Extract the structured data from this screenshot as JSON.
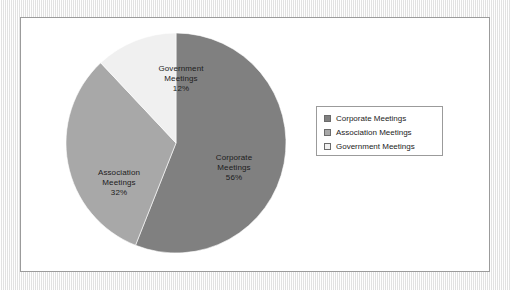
{
  "chart_data": {
    "type": "pie",
    "title": "",
    "subtitle": "",
    "xlabel": "",
    "ylabel": "",
    "grid": false,
    "legend_position": "right",
    "start_angle_deg": 0,
    "direction": "clockwise",
    "categories": [
      "Corporate Meetings",
      "Association Meetings",
      "Government Meetings"
    ],
    "values": [
      56,
      32,
      12
    ],
    "value_unit": "%",
    "colors": [
      "#808080",
      "#a8a8a8",
      "#f0f0f0"
    ],
    "slices": [
      {
        "name": "Corporate Meetings",
        "value": 56,
        "value_label": "56%",
        "color": "#808080",
        "label_lines": [
          "Corporate",
          "Meetings",
          "56%"
        ]
      },
      {
        "name": "Association Meetings",
        "value": 32,
        "value_label": "32%",
        "color": "#a8a8a8",
        "label_lines": [
          "Association",
          "Meetings",
          "32%"
        ]
      },
      {
        "name": "Government Meetings",
        "value": 12,
        "value_label": "12%",
        "color": "#f0f0f0",
        "label_lines": [
          "Government",
          "Meetings",
          "12%"
        ]
      }
    ]
  },
  "pie_labels": {
    "corporate": {
      "line1": "Corporate",
      "line2": "Meetings",
      "line3": "56%"
    },
    "association": {
      "line1": "Association",
      "line2": "Meetings",
      "line3": "32%"
    },
    "government": {
      "line1": "Government",
      "line2": "Meetings",
      "line3": "12%"
    }
  },
  "legend": {
    "items": [
      {
        "label": "Corporate Meetings",
        "color": "#808080"
      },
      {
        "label": "Association Meetings",
        "color": "#a8a8a8"
      },
      {
        "label": "Government Meetings",
        "color": "#f0f0f0"
      }
    ]
  },
  "colors": {
    "frame_border": "#9b9b9b",
    "plot_background": "#ffffff",
    "page_background": "#f2f2f2",
    "text": "#1c1c1c",
    "slice_outline": "#ffffff"
  }
}
